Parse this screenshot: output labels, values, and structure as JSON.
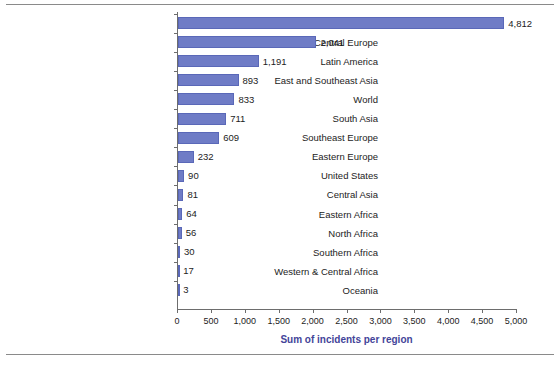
{
  "chart_data": {
    "type": "bar",
    "orientation": "horizontal",
    "title": "",
    "xlabel": "Sum of incidents per region",
    "ylabel": "",
    "xlim": [
      0,
      5000
    ],
    "xticks": [
      "0",
      "500",
      "1,000",
      "1,500",
      "2,000",
      "2,500",
      "3,000",
      "3,500",
      "4,000",
      "4,500",
      "5,000"
    ],
    "xtick_values": [
      0,
      500,
      1000,
      1500,
      2000,
      2500,
      3000,
      3500,
      4000,
      4500,
      5000
    ],
    "grid": false,
    "legend": false,
    "bar_color": "#6f7cc6",
    "axis_title_color": "#434499",
    "categories": [
      "Near and Middle East",
      "Western and Central Europe",
      "Latin America",
      "East and Southeast Asia",
      "World",
      "South Asia",
      "Southeast Europe",
      "Eastern Europe",
      "United States",
      "Central Asia",
      "Eastern Africa",
      "North Africa",
      "Southern Africa",
      "Western & Central Africa",
      "Oceania"
    ],
    "values": [
      4812,
      2041,
      1191,
      893,
      833,
      711,
      609,
      232,
      90,
      81,
      64,
      56,
      30,
      17,
      3
    ],
    "value_labels": [
      "4,812",
      "2,041",
      "1,191",
      "893",
      "833",
      "711",
      "609",
      "232",
      "90",
      "81",
      "64",
      "56",
      "30",
      "17",
      "3"
    ]
  }
}
